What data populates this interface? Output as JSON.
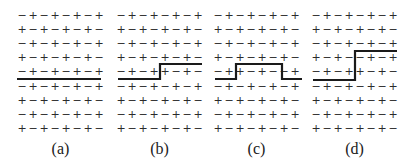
{
  "figure": {
    "grid": {
      "rows": 9,
      "cols": 8,
      "row_y": [
        15,
        29,
        43,
        57,
        71,
        86,
        100,
        114,
        128
      ],
      "col_spacing": 11,
      "label_y": 148
    },
    "panels": [
      {
        "label": "(a)",
        "x0": 22,
        "rows": [
          "-+-+-+-+",
          "+-+-+-+-",
          "-+-+-+-+",
          "+-+-+-+-",
          "-+-+-+-+",
          "-+-+-+-+",
          "+-+-+-+-",
          "-+-+-+-+",
          "+-+-+-+-"
        ],
        "wall": "M17,79 L101,79"
      },
      {
        "label": "(b)",
        "x0": 121,
        "rows": [
          "-+-+-+-+",
          "+-+-+-+-",
          "-+-+-+-+",
          "+-+-+-+-",
          "-+-++-+-",
          "-+-+-+-+",
          "+-+-+-+-",
          "-+-+-+-+",
          "+-+-+-+-"
        ],
        "wall": "M118,79 L160,79 L160,64 L202,64"
      },
      {
        "label": "(c)",
        "x0": 218,
        "rows": [
          "-+-+-+-+",
          "+-+-+-+-",
          "-+-+-+-+",
          "+-+-+-+-",
          "-++-+--+",
          "-+-+-+-+",
          "+-+-+-+-",
          "-+-+-+-+",
          "+-+-+-+-"
        ],
        "wall": "M215,79 L236,79 L236,64 L282,64 L282,79 L302,79"
      },
      {
        "label": "(d)",
        "x0": 316,
        "rows": [
          "-+-+-+-+",
          "+-+-+-+-",
          "-+-+-+-+",
          "+-+--+-+",
          "-+-++-+-",
          "-+-+-+-+",
          "+-+-+-+-",
          "-+-+-+-+",
          "+-+-+-+-"
        ],
        "wall": "M313,80 L355,80 L355,51 L397,51"
      }
    ],
    "symbols": {
      "+": "+",
      "-": "−"
    }
  }
}
